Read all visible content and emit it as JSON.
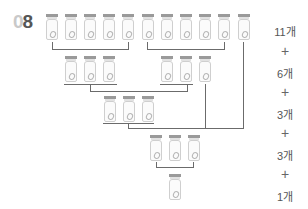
{
  "problem_number": {
    "prefix": "0",
    "digit": "8"
  },
  "rows": [
    {
      "count": 11,
      "label": "11개"
    },
    {
      "count": 6,
      "label": "6개"
    },
    {
      "count": 3,
      "label": "3개"
    },
    {
      "count": 3,
      "label": "3개"
    },
    {
      "count": 1,
      "label": "1개"
    }
  ],
  "operators": [
    "+",
    "+",
    "+",
    "+"
  ],
  "icon": "jar-icon",
  "colors": {
    "cap": "#9a9a9a",
    "outline": "#cfcfcf",
    "line": "#6b6b6b",
    "text": "#555555"
  }
}
